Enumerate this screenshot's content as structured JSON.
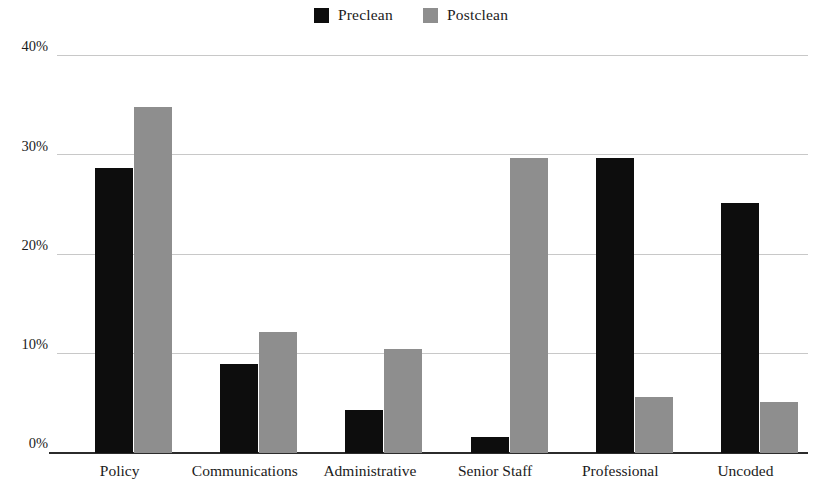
{
  "chart_data": {
    "type": "bar",
    "title": "",
    "subtitle": "",
    "xlabel": "",
    "ylabel": "",
    "ylim": [
      0,
      40
    ],
    "yticks": [
      0,
      10,
      20,
      30,
      40
    ],
    "ytick_labels": [
      "0%",
      "10%",
      "20%",
      "30%",
      "40%"
    ],
    "grid": true,
    "legend_position": "top-center",
    "categories": [
      "Policy",
      "Communications",
      "Administrative",
      "Senior Staff",
      "Professional",
      "Uncoded"
    ],
    "series": [
      {
        "name": "Preclean",
        "color": "#0d0d0d",
        "values": [
          28.7,
          9.0,
          4.3,
          1.6,
          29.7,
          25.2
        ]
      },
      {
        "name": "Postclean",
        "color": "#8e8e8e",
        "values": [
          34.9,
          12.2,
          10.5,
          29.7,
          5.6,
          5.1
        ]
      }
    ]
  },
  "legend": {
    "entries": [
      {
        "label": "Preclean",
        "color": "#0d0d0d"
      },
      {
        "label": "Postclean",
        "color": "#8e8e8e"
      }
    ]
  }
}
